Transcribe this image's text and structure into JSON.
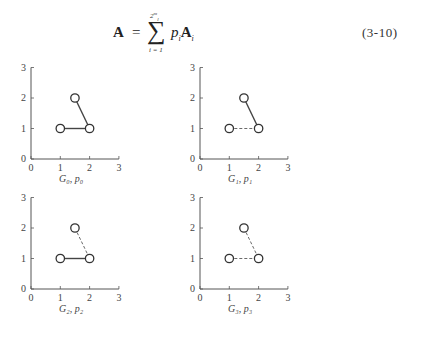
{
  "equation": {
    "lhs": "A",
    "equals": "=",
    "sum_symbol": "∑",
    "sum_upper": "2^m_l",
    "sum_lower": "i = 1",
    "rhs_coeff": "p",
    "rhs_coeff_sub": "i",
    "rhs_matrix": "A",
    "rhs_matrix_sub": "i",
    "number": "(3-10)"
  },
  "plots": [
    {
      "label": "G₀, p₀",
      "edge_13": "solid",
      "edge_23": "solid"
    },
    {
      "label": "G₁, p₁",
      "edge_13": "dashed",
      "edge_23": "solid"
    },
    {
      "label": "G₂, p₂",
      "edge_13": "solid",
      "edge_23": "dashed"
    },
    {
      "label": "G₃, p₃",
      "edge_13": "dashed",
      "edge_23": "dashed"
    }
  ],
  "chart_data": [
    {
      "type": "scatter",
      "title": "G0, p0",
      "x_ticks": [
        "0",
        "1",
        "2",
        "3"
      ],
      "y_ticks": [
        "0",
        "1",
        "2",
        "3"
      ],
      "xlim": [
        0,
        3
      ],
      "ylim": [
        0,
        3
      ],
      "nodes": [
        [
          1,
          1
        ],
        [
          2,
          1
        ],
        [
          1.5,
          2
        ]
      ],
      "edges": [
        {
          "from": [
            1,
            1
          ],
          "to": [
            2,
            1
          ],
          "style": "solid"
        },
        {
          "from": [
            1.5,
            2
          ],
          "to": [
            2,
            1
          ],
          "style": "solid"
        }
      ]
    },
    {
      "type": "scatter",
      "title": "G1, p1",
      "x_ticks": [
        "0",
        "1",
        "2",
        "3"
      ],
      "y_ticks": [
        "0",
        "1",
        "2",
        "3"
      ],
      "xlim": [
        0,
        3
      ],
      "ylim": [
        0,
        3
      ],
      "nodes": [
        [
          1,
          1
        ],
        [
          2,
          1
        ],
        [
          1.5,
          2
        ]
      ],
      "edges": [
        {
          "from": [
            1,
            1
          ],
          "to": [
            2,
            1
          ],
          "style": "dashed"
        },
        {
          "from": [
            1.5,
            2
          ],
          "to": [
            2,
            1
          ],
          "style": "solid"
        }
      ]
    },
    {
      "type": "scatter",
      "title": "G2, p2",
      "x_ticks": [
        "0",
        "1",
        "2",
        "3"
      ],
      "y_ticks": [
        "0",
        "1",
        "2",
        "3"
      ],
      "xlim": [
        0,
        3
      ],
      "ylim": [
        0,
        3
      ],
      "nodes": [
        [
          1,
          1
        ],
        [
          2,
          1
        ],
        [
          1.5,
          2
        ]
      ],
      "edges": [
        {
          "from": [
            1,
            1
          ],
          "to": [
            2,
            1
          ],
          "style": "solid"
        },
        {
          "from": [
            1.5,
            2
          ],
          "to": [
            2,
            1
          ],
          "style": "dashed"
        }
      ]
    },
    {
      "type": "scatter",
      "title": "G3, p3",
      "x_ticks": [
        "0",
        "1",
        "2",
        "3"
      ],
      "y_ticks": [
        "0",
        "1",
        "2",
        "3"
      ],
      "xlim": [
        0,
        3
      ],
      "ylim": [
        0,
        3
      ],
      "nodes": [
        [
          1,
          1
        ],
        [
          2,
          1
        ],
        [
          1.5,
          2
        ]
      ],
      "edges": [
        {
          "from": [
            1,
            1
          ],
          "to": [
            2,
            1
          ],
          "style": "dashed"
        },
        {
          "from": [
            1.5,
            2
          ],
          "to": [
            2,
            1
          ],
          "style": "dashed"
        }
      ]
    }
  ]
}
